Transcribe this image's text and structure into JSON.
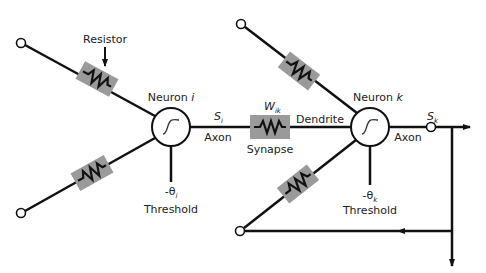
{
  "diagram": {
    "colors": {
      "line": "#111111",
      "resistor_box": "#9a9a9a",
      "background": "#ffffff"
    },
    "labels": {
      "resistor": "Resistor",
      "neuron_i": "Neuron ",
      "neuron_i_var": "i",
      "neuron_k": "Neuron ",
      "neuron_k_var": "k",
      "s_i": "S",
      "s_i_sub": "i",
      "axon_i": "Axon",
      "w_ik": "W",
      "w_ik_sub": "ik",
      "synapse": "Synapse",
      "dendrite": "Dendrite",
      "s_k": "S",
      "s_k_sub": "k",
      "axon_k": "Axon",
      "theta_i": "-θ",
      "theta_i_sub": "i",
      "threshold_i": "Threshold",
      "theta_k": "-θ",
      "theta_k_sub": "k",
      "threshold_k": "Threshold"
    },
    "nodes": [
      {
        "id": "neuron-i",
        "type": "neuron",
        "cx": 171,
        "cy": 127,
        "r": 19
      },
      {
        "id": "neuron-k",
        "type": "neuron",
        "cx": 370,
        "cy": 127,
        "r": 19
      },
      {
        "id": "input-top-left",
        "type": "terminal",
        "cx": 21,
        "cy": 43
      },
      {
        "id": "input-bottom-left",
        "type": "terminal",
        "cx": 21,
        "cy": 213
      },
      {
        "id": "input-top-right",
        "type": "terminal",
        "cx": 241,
        "cy": 24
      },
      {
        "id": "input-bottom-right",
        "type": "terminal",
        "cx": 240,
        "cy": 231
      },
      {
        "id": "output-sk",
        "type": "terminal",
        "cx": 431,
        "cy": 127
      }
    ]
  }
}
